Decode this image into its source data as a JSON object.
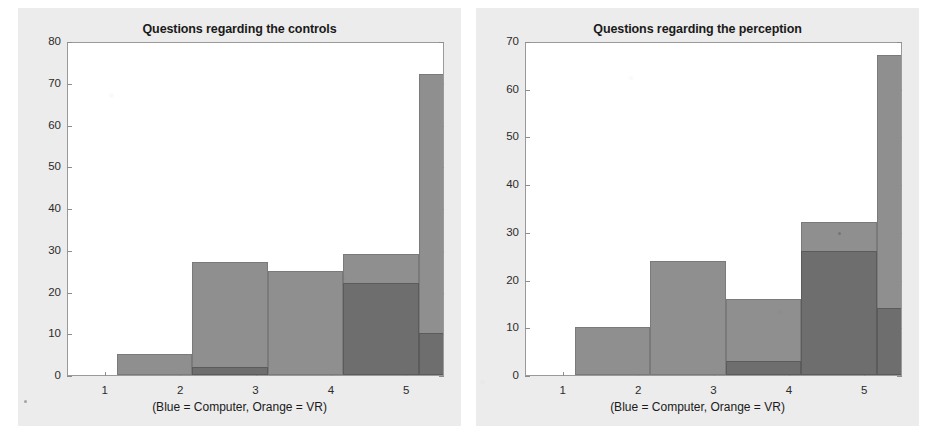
{
  "page": {
    "background": "#ffffff",
    "figure_background": "#ececec",
    "plot_background": "#ffffff",
    "axis_color": "#9a9a9a"
  },
  "legend_note": "(Blue = Computer, Orange = VR)",
  "series_colors": {
    "computer": "#6e6e6e",
    "vr": "#8f8f8f"
  },
  "chart_data": [
    {
      "type": "bar",
      "id": "controls",
      "title": "Questions regarding the controls",
      "xlabel": "(Blue = Computer, Orange = VR)",
      "ylabel": "",
      "categories": [
        "1",
        "2",
        "3",
        "4",
        "5"
      ],
      "xticklabels": [
        "1",
        "2",
        "3",
        "4",
        "5"
      ],
      "yticklabels": [
        "0",
        "10",
        "20",
        "30",
        "40",
        "50",
        "60",
        "70",
        "80"
      ],
      "ylim": [
        0,
        80
      ],
      "ytick_step": 10,
      "grid": false,
      "overlay": true,
      "legend_position": "below-axis-as-text",
      "series": [
        {
          "name": "Computer",
          "color": "#6e6e6e",
          "values": [
            0,
            2,
            0,
            22,
            10
          ]
        },
        {
          "name": "VR",
          "color": "#8f8f8f",
          "values": [
            5,
            27,
            25,
            29,
            72
          ]
        }
      ]
    },
    {
      "type": "bar",
      "id": "perception",
      "title": "Questions regarding the perception",
      "xlabel": "(Blue = Computer, Orange = VR)",
      "ylabel": "",
      "categories": [
        "1",
        "2",
        "3",
        "4",
        "5"
      ],
      "xticklabels": [
        "1",
        "2",
        "3",
        "4",
        "5"
      ],
      "yticklabels": [
        "0",
        "10",
        "20",
        "30",
        "40",
        "50",
        "60",
        "70"
      ],
      "ylim": [
        0,
        70
      ],
      "ytick_step": 10,
      "grid": false,
      "overlay": true,
      "legend_position": "below-axis-as-text",
      "series": [
        {
          "name": "Computer",
          "color": "#6e6e6e",
          "values": [
            0,
            0,
            3,
            26,
            14
          ]
        },
        {
          "name": "VR",
          "color": "#8f8f8f",
          "values": [
            10,
            24,
            16,
            32,
            67
          ]
        }
      ]
    }
  ]
}
